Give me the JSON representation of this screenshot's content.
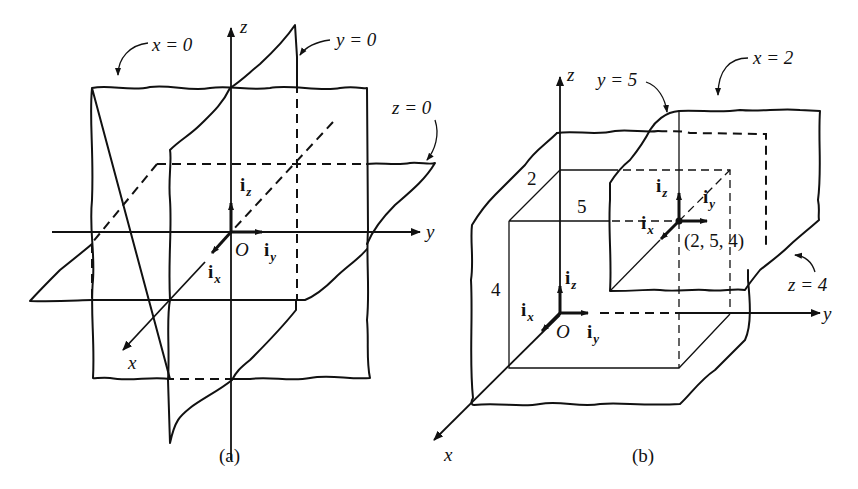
{
  "figure_a": {
    "caption": "(a)",
    "axes": {
      "x": "x",
      "y": "y",
      "z": "z",
      "origin": "O"
    },
    "plane_labels": {
      "x_plane": "x = 0",
      "y_plane": "y = 0",
      "z_plane": "z = 0"
    },
    "unit_vectors": {
      "ix": {
        "base": "i",
        "sub": "x"
      },
      "iy": {
        "base": "i",
        "sub": "y"
      },
      "iz": {
        "base": "i",
        "sub": "z"
      }
    }
  },
  "figure_b": {
    "caption": "(b)",
    "axes": {
      "x": "x",
      "y": "y",
      "z": "z",
      "origin": "O"
    },
    "plane_labels": {
      "x_plane": "x = 2",
      "y_plane": "y = 5",
      "z_plane": "z = 4"
    },
    "dimensions": {
      "x_len": "2",
      "y_len": "5",
      "z_len": "4"
    },
    "point": "(2,  5,  4)",
    "unit_vectors_origin": {
      "ix": {
        "base": "i",
        "sub": "x"
      },
      "iy": {
        "base": "i",
        "sub": "y"
      },
      "iz": {
        "base": "i",
        "sub": "z"
      }
    },
    "unit_vectors_point": {
      "ix": {
        "base": "i",
        "sub": "x"
      },
      "iy": {
        "base": "i",
        "sub": "y"
      },
      "iz": {
        "base": "i",
        "sub": "z"
      }
    }
  }
}
